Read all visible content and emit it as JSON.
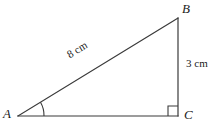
{
  "figure": {
    "background_color": "#ffffff",
    "stroke_color": "#3a3a3a",
    "text_color": "#1a1a1a"
  },
  "vertices": {
    "a": {
      "label": "A",
      "x": 18,
      "y": 116
    },
    "b": {
      "label": "B",
      "x": 178,
      "y": 18
    },
    "c": {
      "label": "C",
      "x": 178,
      "y": 116
    }
  },
  "sides": {
    "hypotenuse": {
      "name": "AB",
      "label": "8 cm",
      "length": 8,
      "unit": "cm"
    },
    "vertical": {
      "name": "BC",
      "label": "3 cm",
      "length": 3,
      "unit": "cm"
    },
    "base": {
      "name": "AC",
      "label": "",
      "length": null,
      "unit": "cm"
    }
  },
  "markers": {
    "angle_arc_a": {
      "name": "angle-A",
      "label": ""
    },
    "right_angle_c": {
      "name": "right-angle-C",
      "label": ""
    }
  },
  "geometry": {
    "paths": {
      "hypotenuse": "M 18 116 L 178 18",
      "vertical": "M 178 18 L 178 116",
      "base": "M 18 116 L 178 116",
      "angle_arc": "M 44 116 A 26 26 0 0 0 40.5 102.3",
      "right_angle_square": "M 168 116 L 168 106 L 178 106"
    }
  }
}
